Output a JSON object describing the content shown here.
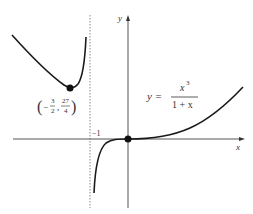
{
  "figure": {
    "type": "function-graph",
    "function_label": {
      "lhs": "y =",
      "numerator": "x",
      "numerator_exp": "3",
      "denominator": "1 + x"
    },
    "axes": {
      "x_label": "x",
      "y_label": "y"
    },
    "asymptote": {
      "label": "−1",
      "value": -1,
      "style": "dotted"
    },
    "critical_point": {
      "label_open": "(",
      "x_sign": "−",
      "x_num": "3",
      "x_den": "2",
      "separator": ",",
      "y_num": "27",
      "y_den": "4",
      "label_close": ")",
      "x": -1.5,
      "y": 6.75
    },
    "origin_point": {
      "x": 0,
      "y": 0
    },
    "colors": {
      "curve": "#1a1a1a",
      "axis": "#555555",
      "asymptote": "#888888",
      "point": "#111111"
    }
  }
}
